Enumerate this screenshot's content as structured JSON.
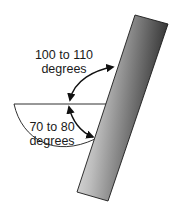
{
  "diagram": {
    "upper_angle": {
      "line1": "100 to 110",
      "line2": "degrees"
    },
    "lower_angle": {
      "line1": "70 to 80",
      "line2": "degrees"
    }
  },
  "colors": {
    "stroke": "#1a1a1a",
    "bar_light": "#f2f2f2",
    "bar_dark": "#3a3a3a",
    "background": "#ffffff"
  }
}
